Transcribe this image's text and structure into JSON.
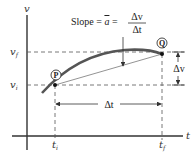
{
  "diagram": {
    "axes": {
      "vertical_label": "v",
      "horizontal_label": "t"
    },
    "levels": {
      "v_final": "v",
      "v_final_sub": "f",
      "v_initial": "v",
      "v_initial_sub": "i"
    },
    "times": {
      "t_initial": "t",
      "t_initial_sub": "i",
      "t_final": "t",
      "t_final_sub": "f"
    },
    "points": {
      "start": "P",
      "end": "Q"
    },
    "slope_label": {
      "prefix": "Slope = ",
      "abar": "a",
      "equals": " = ",
      "numerator": "Δv",
      "denominator": "Δt"
    },
    "delta_v": "Δv",
    "delta_t": "Δt",
    "colors": {
      "curve": "#555555",
      "axis": "#333333",
      "dashed": "#555555",
      "chord": "#777777"
    }
  }
}
